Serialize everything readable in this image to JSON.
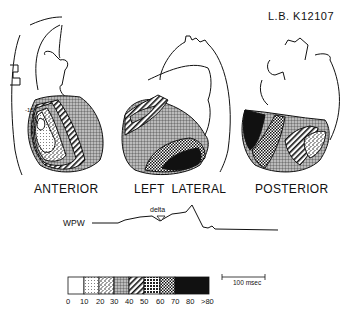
{
  "header": {
    "patient_id": "L.B.  K12107"
  },
  "views": [
    {
      "label": "ANTERIOR",
      "annotation": "-15"
    },
    {
      "label": "LEFT  LATERAL"
    },
    {
      "label": "POSTERIOR"
    }
  ],
  "trace": {
    "label": "WPW",
    "marker_label": "delta"
  },
  "legend": {
    "ticks": [
      "0",
      "10",
      "20",
      "30",
      "40",
      "50",
      "60",
      "70",
      "80",
      ">80"
    ],
    "patterns": [
      "blank",
      "fine-dots",
      "coarse-speckle",
      "fine-grid",
      "diagonal-hatch",
      "dense-speckle",
      "checker",
      "solid-black"
    ]
  },
  "scale_bar": {
    "label": "100 msec"
  }
}
